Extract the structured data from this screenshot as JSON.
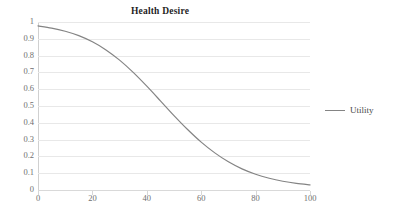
{
  "chart_data": {
    "type": "line",
    "title": "Health Desire",
    "xlabel": "",
    "ylabel": "",
    "xlim": [
      0,
      100
    ],
    "ylim": [
      0,
      1
    ],
    "grid": true,
    "legend_position": "right",
    "x_ticks": [
      "0",
      "20",
      "40",
      "60",
      "80",
      "100"
    ],
    "x_tick_values": [
      0,
      20,
      40,
      60,
      80,
      100
    ],
    "y_ticks": [
      "0",
      "0.1",
      "0.2",
      "0.3",
      "0.4",
      "0.5",
      "0.6",
      "0.7",
      "0.8",
      "0.9",
      "1"
    ],
    "y_tick_values": [
      0,
      0.1,
      0.2,
      0.3,
      0.4,
      0.5,
      0.6,
      0.7,
      0.8,
      0.9,
      1
    ],
    "series": [
      {
        "name": "Utility",
        "color": "#848484",
        "x": [
          0,
          5,
          10,
          15,
          20,
          25,
          30,
          35,
          40,
          45,
          50,
          55,
          60,
          65,
          70,
          75,
          80,
          85,
          90,
          95,
          100
        ],
        "values": [
          0.977,
          0.964,
          0.945,
          0.919,
          0.882,
          0.834,
          0.773,
          0.7,
          0.618,
          0.531,
          0.443,
          0.36,
          0.285,
          0.221,
          0.168,
          0.126,
          0.094,
          0.07,
          0.052,
          0.039,
          0.03
        ]
      }
    ]
  },
  "legend": {
    "entries": [
      {
        "label": "Utility",
        "color": "#848484"
      }
    ]
  }
}
